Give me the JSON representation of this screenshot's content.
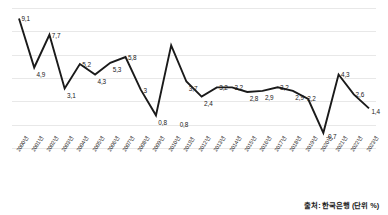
{
  "chart_data": {
    "type": "line",
    "title": "",
    "subtitle": "",
    "xlabel": "",
    "ylabel": "",
    "unit_note": "출처: 한국은행 (단위 %)",
    "source": "한국은행",
    "unit": "%",
    "grid": true,
    "legend_position": "none",
    "ylim": [
      -2,
      10
    ],
    "gridline_values": [
      10,
      8,
      6,
      4,
      2,
      0,
      -2
    ],
    "categories": [
      "2000년",
      "2001년",
      "2002년",
      "2003년",
      "2004년",
      "2005년",
      "2006년",
      "2007년",
      "2008년",
      "2009년",
      "2010년",
      "2011년",
      "2012년",
      "2013년",
      "2014년",
      "2015년",
      "2016년",
      "2017년",
      "2018년",
      "2019년",
      "2020년",
      "2021년",
      "2022년",
      "2023년"
    ],
    "values": [
      9.1,
      4.9,
      7.7,
      3.1,
      5.2,
      4.3,
      5.3,
      5.8,
      3.0,
      0.8,
      6.8,
      3.7,
      2.4,
      3.2,
      3.2,
      2.8,
      2.9,
      3.2,
      2.9,
      2.2,
      -0.7,
      4.3,
      2.6,
      1.4
    ],
    "point_labels": [
      "9,1",
      "4,9",
      "7,7",
      "3,1",
      "5,2",
      "4,3",
      "5,3",
      "5,8",
      "3",
      "0,8",
      "",
      "3,7",
      "2,4",
      "3,2",
      "3,2",
      "2,8",
      "2,9",
      "3,2",
      "2,9",
      "2,2",
      "-0,7",
      "4,3",
      "2,6",
      "1,4"
    ],
    "extra_labels": [
      {
        "text": "0,8",
        "x_index": 10.4,
        "value": 0.55
      }
    ],
    "series": [
      {
        "name": "",
        "color": "#1a1a1a",
        "values": [
          9.1,
          4.9,
          7.7,
          3.1,
          5.2,
          4.3,
          5.3,
          5.8,
          3.0,
          0.8,
          6.8,
          3.7,
          2.4,
          3.2,
          3.2,
          2.8,
          2.9,
          3.2,
          2.9,
          2.2,
          -0.7,
          4.3,
          2.6,
          1.4
        ]
      }
    ],
    "colors": {
      "line": "#1a1a1a",
      "grid": "#e8e8e8",
      "text": "#1a1a1a",
      "background": "#ffffff"
    }
  }
}
